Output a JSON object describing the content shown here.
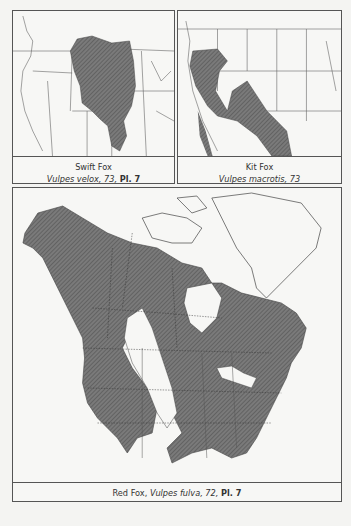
{
  "maps": [
    {
      "id": "swift-fox",
      "common_name": "Swift Fox",
      "scientific_name": "Vulpes velox",
      "page": ", 73, ",
      "plate": "Pl. 7"
    },
    {
      "id": "kit-fox",
      "common_name": "Kit Fox",
      "scientific_name": "Vulpes macrotis",
      "page": ", 73",
      "plate": ""
    },
    {
      "id": "red-fox",
      "common_name": "Red Fox",
      "separator": ", ",
      "scientific_name": "Vulpes fulva",
      "page": ", 72, ",
      "plate": "Pl. 7"
    }
  ],
  "colors": {
    "range_fill": "#6e6e6e",
    "border": "#555555",
    "background": "#f7f7f5"
  }
}
